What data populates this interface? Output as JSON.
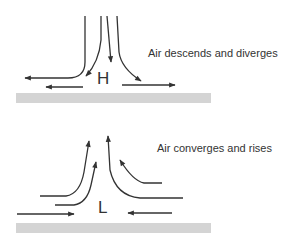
{
  "high_pressure": {
    "symbol": "H",
    "caption": "Air descends and diverges"
  },
  "low_pressure": {
    "symbol": "L",
    "caption": "Air converges and rises"
  },
  "colors": {
    "arrow": "#333333",
    "ground": "#d4d4d4",
    "text": "#333333"
  }
}
